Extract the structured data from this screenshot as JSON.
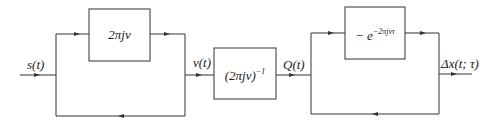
{
  "diagram": {
    "type": "block-diagram",
    "signals": {
      "input": "s(t)",
      "after_first_stage": "v(t)",
      "after_integrator": "Q(t)",
      "output": "Δx(t; τ)"
    },
    "blocks": [
      {
        "id": "differentiator",
        "base": "2πjν",
        "sup": ""
      },
      {
        "id": "integrator",
        "base": "(2πjν)",
        "sup": "−1"
      },
      {
        "id": "delay",
        "base": "− e",
        "sup": "−2πjντ"
      }
    ],
    "stages": [
      {
        "name": "first-parallel-stage",
        "upper_path": "differentiator",
        "lower_path": "bypass"
      },
      {
        "name": "series-integrator",
        "block": "integrator"
      },
      {
        "name": "second-parallel-stage",
        "upper_path": "delay",
        "lower_path": "bypass"
      }
    ],
    "colors": {
      "line": "#333333",
      "background": "#ffffff"
    }
  }
}
